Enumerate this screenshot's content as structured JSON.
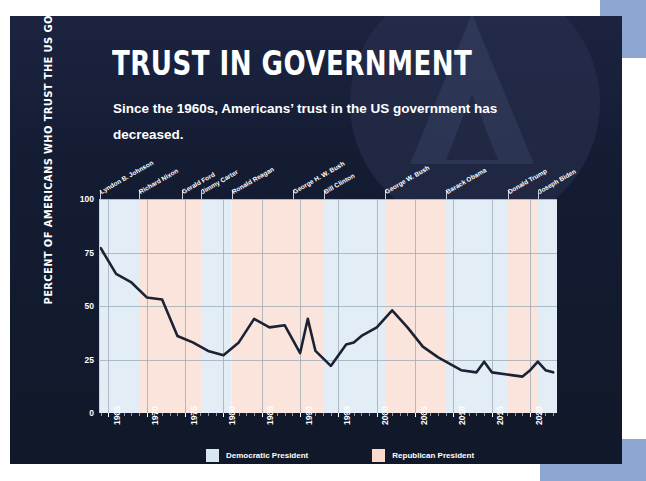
{
  "title": "TRUST IN GOVERNMENT",
  "subtitle": "Since the 1960s, Americans’ trust in the US government has decreased.",
  "colors": {
    "card_background": "#141c33",
    "plot_background": "#eef3f8",
    "democratic_band": "#e3edf5",
    "republican_band": "#fbe4dc",
    "line": "#1b2233",
    "text": "#ffffff",
    "accent_block": "#8ea7d2"
  },
  "legend": {
    "position": "bottom-center",
    "items": [
      {
        "label": "Democratic President",
        "color": "#d8e7f2"
      },
      {
        "label": "Republican President",
        "color": "#fbd9cc"
      }
    ]
  },
  "presidents": [
    {
      "name": "Lyndon B. Johnson",
      "start": 1963.9,
      "end": 1969.05,
      "party": "Democratic"
    },
    {
      "name": "Richard Nixon",
      "start": 1969.05,
      "end": 1974.6,
      "party": "Republican"
    },
    {
      "name": "Gerald Ford",
      "start": 1974.6,
      "end": 1977.05,
      "party": "Republican"
    },
    {
      "name": "Jimmy Carter",
      "start": 1977.05,
      "end": 1981.05,
      "party": "Democratic"
    },
    {
      "name": "Ronald Reagan",
      "start": 1981.05,
      "end": 1989.05,
      "party": "Republican"
    },
    {
      "name": "George H. W. Bush",
      "start": 1989.05,
      "end": 1993.05,
      "party": "Republican"
    },
    {
      "name": "Bill Clinton",
      "start": 1993.05,
      "end": 2001.05,
      "party": "Democratic"
    },
    {
      "name": "George W. Bush",
      "start": 2001.05,
      "end": 2009.05,
      "party": "Republican"
    },
    {
      "name": "Barack Obama",
      "start": 2009.05,
      "end": 2017.05,
      "party": "Democratic"
    },
    {
      "name": "Donald Trump",
      "start": 2017.05,
      "end": 2021.05,
      "party": "Republican"
    },
    {
      "name": "Joseph Biden",
      "start": 2021.05,
      "end": 2023.5,
      "party": "Democratic"
    }
  ],
  "chart_data": {
    "type": "line",
    "title": "TRUST IN GOVERNMENT",
    "xlabel": "",
    "ylabel": "PERCENT OF AMERICANS WHO TRUST THE US GOVERNMENT",
    "xlim": [
      1963.9,
      2023.5
    ],
    "ylim": [
      0,
      100
    ],
    "yticks": [
      0,
      25,
      50,
      75,
      100
    ],
    "xticks": [
      1965,
      1970,
      1975,
      1980,
      1985,
      1990,
      1995,
      2000,
      2005,
      2010,
      2015,
      2020
    ],
    "grid": true,
    "series": [
      {
        "name": "Percent who trust the US government",
        "x": [
          1964,
          1966,
          1968,
          1970,
          1972,
          1974,
          1976,
          1978,
          1980,
          1982,
          1984,
          1986,
          1988,
          1990,
          1991,
          1992,
          1994,
          1996,
          1997,
          1998,
          2000,
          2001,
          2002,
          2003,
          2004,
          2006,
          2008,
          2010,
          2011,
          2013,
          2014,
          2015,
          2017,
          2019,
          2020,
          2021,
          2022,
          2023
        ],
        "y": [
          77,
          65,
          61,
          54,
          53,
          36,
          33,
          29,
          27,
          33,
          44,
          40,
          41,
          28,
          44,
          29,
          22,
          32,
          33,
          36,
          40,
          44,
          48,
          44,
          40,
          31,
          26,
          22,
          20,
          19,
          24,
          19,
          18,
          17,
          20,
          24,
          20,
          19
        ]
      }
    ]
  }
}
